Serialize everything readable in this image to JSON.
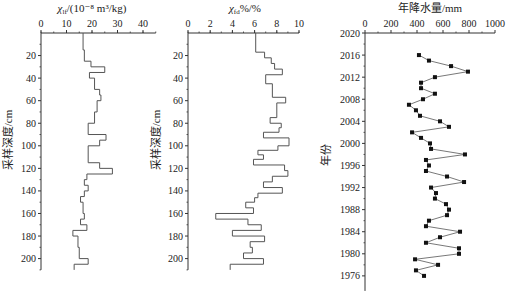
{
  "chart_data": [
    {
      "type": "line",
      "subtype": "step-profile",
      "title": "",
      "xlabel": "χlf/(10⁻⁸ m³/kg)",
      "ylabel": "采样深度/cm",
      "xlim": [
        0,
        45
      ],
      "ylim": [
        210,
        0
      ],
      "xticks": [
        "0",
        "10",
        "20",
        "30",
        "40"
      ],
      "yticks": [
        "20",
        "40",
        "60",
        "80",
        "100",
        "120",
        "140",
        "160",
        "180",
        "200"
      ],
      "grid": false,
      "segments": [
        {
          "depth_top": 0,
          "depth_bottom": 15,
          "value": 16.5
        },
        {
          "depth_top": 15,
          "depth_bottom": 25,
          "value": 17
        },
        {
          "depth_top": 25,
          "depth_bottom": 30,
          "value": 19.6
        },
        {
          "depth_top": 30,
          "depth_bottom": 35,
          "value": 25
        },
        {
          "depth_top": 35,
          "depth_bottom": 40,
          "value": 19
        },
        {
          "depth_top": 40,
          "depth_bottom": 50,
          "value": 21
        },
        {
          "depth_top": 50,
          "depth_bottom": 55,
          "value": 23
        },
        {
          "depth_top": 55,
          "depth_bottom": 60,
          "value": 23.5
        },
        {
          "depth_top": 60,
          "depth_bottom": 70,
          "value": 22
        },
        {
          "depth_top": 70,
          "depth_bottom": 80,
          "value": 21
        },
        {
          "depth_top": 80,
          "depth_bottom": 90,
          "value": 18.5
        },
        {
          "depth_top": 90,
          "depth_bottom": 95,
          "value": 25.5
        },
        {
          "depth_top": 95,
          "depth_bottom": 100,
          "value": 23
        },
        {
          "depth_top": 100,
          "depth_bottom": 115,
          "value": 18.5
        },
        {
          "depth_top": 115,
          "depth_bottom": 120,
          "value": 23
        },
        {
          "depth_top": 120,
          "depth_bottom": 125,
          "value": 28
        },
        {
          "depth_top": 125,
          "depth_bottom": 130,
          "value": 18
        },
        {
          "depth_top": 130,
          "depth_bottom": 135,
          "value": 17
        },
        {
          "depth_top": 135,
          "depth_bottom": 140,
          "value": 18.5
        },
        {
          "depth_top": 140,
          "depth_bottom": 145,
          "value": 17
        },
        {
          "depth_top": 145,
          "depth_bottom": 150,
          "value": 15.5
        },
        {
          "depth_top": 150,
          "depth_bottom": 160,
          "value": 16.5
        },
        {
          "depth_top": 160,
          "depth_bottom": 165,
          "value": 17
        },
        {
          "depth_top": 165,
          "depth_bottom": 170,
          "value": 15.5
        },
        {
          "depth_top": 170,
          "depth_bottom": 175,
          "value": 18
        },
        {
          "depth_top": 175,
          "depth_bottom": 180,
          "value": 12.5
        },
        {
          "depth_top": 180,
          "depth_bottom": 190,
          "value": 14.5
        },
        {
          "depth_top": 190,
          "depth_bottom": 200,
          "value": 15
        },
        {
          "depth_top": 200,
          "depth_bottom": 205,
          "value": 18.5
        },
        {
          "depth_top": 205,
          "depth_bottom": 210,
          "value": 13
        }
      ]
    },
    {
      "type": "line",
      "subtype": "step-profile",
      "title": "",
      "xlabel": "χfd%/%",
      "ylabel": "采样深度/cm",
      "xlim": [
        0,
        10
      ],
      "ylim": [
        210,
        0
      ],
      "xticks": [
        "0",
        "2",
        "4",
        "6",
        "8",
        "10"
      ],
      "yticks": [
        "20",
        "40",
        "60",
        "80",
        "100",
        "120",
        "140",
        "160",
        "180",
        "200"
      ],
      "grid": false,
      "segments": [
        {
          "depth_top": 0,
          "depth_bottom": 17,
          "value": 6.1
        },
        {
          "depth_top": 17,
          "depth_bottom": 22,
          "value": 6.9
        },
        {
          "depth_top": 22,
          "depth_bottom": 27,
          "value": 7.5
        },
        {
          "depth_top": 27,
          "depth_bottom": 32,
          "value": 7.8
        },
        {
          "depth_top": 32,
          "depth_bottom": 37,
          "value": 8.5
        },
        {
          "depth_top": 37,
          "depth_bottom": 45,
          "value": 7.0
        },
        {
          "depth_top": 45,
          "depth_bottom": 57,
          "value": 7.6
        },
        {
          "depth_top": 57,
          "depth_bottom": 62,
          "value": 8.8
        },
        {
          "depth_top": 62,
          "depth_bottom": 75,
          "value": 8.0
        },
        {
          "depth_top": 75,
          "depth_bottom": 80,
          "value": 7.4
        },
        {
          "depth_top": 80,
          "depth_bottom": 84,
          "value": 8.4
        },
        {
          "depth_top": 84,
          "depth_bottom": 88,
          "value": 8.2
        },
        {
          "depth_top": 88,
          "depth_bottom": 93,
          "value": 6.8
        },
        {
          "depth_top": 93,
          "depth_bottom": 100,
          "value": 9.1
        },
        {
          "depth_top": 100,
          "depth_bottom": 104,
          "value": 8.1
        },
        {
          "depth_top": 104,
          "depth_bottom": 108,
          "value": 6.3
        },
        {
          "depth_top": 108,
          "depth_bottom": 112,
          "value": 6.8
        },
        {
          "depth_top": 112,
          "depth_bottom": 117,
          "value": 5.9
        },
        {
          "depth_top": 117,
          "depth_bottom": 122,
          "value": 8.7
        },
        {
          "depth_top": 122,
          "depth_bottom": 127,
          "value": 9.0
        },
        {
          "depth_top": 127,
          "depth_bottom": 132,
          "value": 7.6
        },
        {
          "depth_top": 132,
          "depth_bottom": 137,
          "value": 6.8
        },
        {
          "depth_top": 137,
          "depth_bottom": 142,
          "value": 8.5
        },
        {
          "depth_top": 142,
          "depth_bottom": 146,
          "value": 6.3
        },
        {
          "depth_top": 146,
          "depth_bottom": 150,
          "value": 6.0
        },
        {
          "depth_top": 150,
          "depth_bottom": 155,
          "value": 5.2
        },
        {
          "depth_top": 155,
          "depth_bottom": 160,
          "value": 5.9
        },
        {
          "depth_top": 160,
          "depth_bottom": 165,
          "value": 2.5
        },
        {
          "depth_top": 165,
          "depth_bottom": 170,
          "value": 5.4
        },
        {
          "depth_top": 170,
          "depth_bottom": 175,
          "value": 6.6
        },
        {
          "depth_top": 175,
          "depth_bottom": 180,
          "value": 4.0
        },
        {
          "depth_top": 180,
          "depth_bottom": 185,
          "value": 6.9
        },
        {
          "depth_top": 185,
          "depth_bottom": 190,
          "value": 5.6
        },
        {
          "depth_top": 190,
          "depth_bottom": 195,
          "value": 5.8
        },
        {
          "depth_top": 195,
          "depth_bottom": 200,
          "value": 5.0
        },
        {
          "depth_top": 200,
          "depth_bottom": 205,
          "value": 6.8
        },
        {
          "depth_top": 205,
          "depth_bottom": 210,
          "value": 3.8
        }
      ]
    },
    {
      "type": "line",
      "subtype": "line-with-markers",
      "title": "",
      "xlabel": "年降水量/mm",
      "ylabel": "年份",
      "xlim": [
        0,
        1000
      ],
      "ylim": [
        1974,
        2020
      ],
      "xticks": [
        "0",
        "200",
        "400",
        "600",
        "800",
        "1000"
      ],
      "yticks": [
        "2020",
        "2016",
        "2012",
        "2008",
        "2004",
        "2000",
        "1996",
        "1992",
        "1988",
        "1984",
        "1980",
        "1976"
      ],
      "grid": false,
      "marker": "square",
      "points": [
        {
          "year": 2016,
          "value": 415
        },
        {
          "year": 2015,
          "value": 492
        },
        {
          "year": 2014,
          "value": 662
        },
        {
          "year": 2013,
          "value": 792
        },
        {
          "year": 2012,
          "value": 538
        },
        {
          "year": 2011,
          "value": 431
        },
        {
          "year": 2010,
          "value": 431
        },
        {
          "year": 2009,
          "value": 538
        },
        {
          "year": 2008,
          "value": 446
        },
        {
          "year": 2007,
          "value": 338
        },
        {
          "year": 2006,
          "value": 392
        },
        {
          "year": 2005,
          "value": 423
        },
        {
          "year": 2004,
          "value": 577
        },
        {
          "year": 2003,
          "value": 646
        },
        {
          "year": 2002,
          "value": 362
        },
        {
          "year": 2001,
          "value": 431
        },
        {
          "year": 2000,
          "value": 500
        },
        {
          "year": 1999,
          "value": 508
        },
        {
          "year": 1998,
          "value": 769
        },
        {
          "year": 1997,
          "value": 469
        },
        {
          "year": 1996,
          "value": 492
        },
        {
          "year": 1995,
          "value": 469
        },
        {
          "year": 1994,
          "value": 631
        },
        {
          "year": 1993,
          "value": 762
        },
        {
          "year": 1992,
          "value": 508
        },
        {
          "year": 1991,
          "value": 546
        },
        {
          "year": 1990,
          "value": 538
        },
        {
          "year": 1989,
          "value": 623
        },
        {
          "year": 1988,
          "value": 646
        },
        {
          "year": 1987,
          "value": 631
        },
        {
          "year": 1986,
          "value": 492
        },
        {
          "year": 1985,
          "value": 469
        },
        {
          "year": 1984,
          "value": 731
        },
        {
          "year": 1983,
          "value": 577
        },
        {
          "year": 1982,
          "value": 469
        },
        {
          "year": 1981,
          "value": 723
        },
        {
          "year": 1980,
          "value": 723
        },
        {
          "year": 1979,
          "value": 385
        },
        {
          "year": 1978,
          "value": 562
        },
        {
          "year": 1977,
          "value": 392
        },
        {
          "year": 1976,
          "value": 454
        }
      ]
    }
  ],
  "labels": {
    "panel1_xlabel_main": "χ",
    "panel1_xlabel_sub": "lf",
    "panel1_xlabel_rest": "/(10⁻⁸ m³/kg)",
    "panel2_xlabel_main": "χ",
    "panel2_xlabel_sub": "fd",
    "panel2_xlabel_rest": "%/%",
    "depth_ylabel": "采样深度/cm",
    "panel3_xlabel": "年降水量/mm",
    "panel3_ylabel": "年份"
  },
  "colors": {
    "axis": "#333333",
    "line": "#555555",
    "marker": "#111111"
  }
}
